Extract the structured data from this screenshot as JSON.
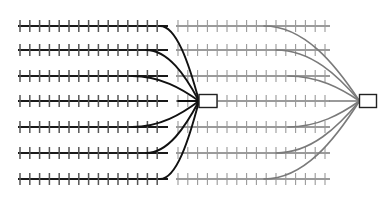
{
  "diagram": {
    "type": "rail-network-schematic",
    "canvas": {
      "width": 388,
      "height": 204,
      "background": "#ffffff"
    },
    "colors": {
      "left_rail": "#1a1a1a",
      "right_rail": "#7a7a7a",
      "left_tie": "#555555",
      "right_tie": "#9a9a9a",
      "connector": "#111111",
      "node_fill": "#ffffff",
      "node_stroke": "#222222"
    },
    "geometry": {
      "rail_width_left": 1.9,
      "rail_width_right": 1.3,
      "tie_width_left": 1.5,
      "tie_width_right": 1.1,
      "tie_half_height": 6,
      "tie_spacing": 9.8,
      "connector_width": 1.9
    },
    "rows": [
      {
        "index": 0,
        "label": "track-1",
        "y": 26
      },
      {
        "index": 1,
        "label": "track-2",
        "y": 50
      },
      {
        "index": 2,
        "label": "track-3",
        "y": 76
      },
      {
        "index": 3,
        "label": "track-4",
        "y": 101
      },
      {
        "index": 4,
        "label": "track-5",
        "y": 127
      },
      {
        "index": 5,
        "label": "track-6",
        "y": 153
      },
      {
        "index": 6,
        "label": "track-7",
        "y": 179
      }
    ],
    "left_segments": {
      "x_start": 18,
      "x_end": 168,
      "description": "Seven dark parallel track runs forming the left fan"
    },
    "right_segments": {
      "x_start": 176,
      "x_end": 330,
      "description": "Seven light grey parallel track runs forming the right fan"
    },
    "nodes": [
      {
        "name": "center-node",
        "x": 208,
        "y": 101,
        "width": 18,
        "height": 13,
        "role": "central junction / interchange"
      },
      {
        "name": "right-node",
        "x": 368,
        "y": 101,
        "width": 17,
        "height": 13,
        "role": "right terminal junction"
      }
    ],
    "left_connectors": [
      {
        "from_row": 0,
        "to_node": "center-node",
        "side": "left",
        "style": "dark"
      },
      {
        "from_row": 1,
        "to_node": "center-node",
        "side": "left",
        "style": "dark"
      },
      {
        "from_row": 2,
        "to_node": "center-node",
        "side": "left",
        "style": "dark"
      },
      {
        "from_row": 3,
        "to_node": "center-node",
        "side": "left",
        "style": "dark"
      },
      {
        "from_row": 4,
        "to_node": "center-node",
        "side": "left",
        "style": "dark"
      },
      {
        "from_row": 5,
        "to_node": "center-node",
        "side": "left",
        "style": "dark"
      },
      {
        "from_row": 6,
        "to_node": "center-node",
        "side": "left",
        "style": "dark"
      }
    ],
    "right_connectors": [
      {
        "from_row": 0,
        "to_node": "right-node",
        "side": "right",
        "style": "grey"
      },
      {
        "from_row": 1,
        "to_node": "right-node",
        "side": "right",
        "style": "grey"
      },
      {
        "from_row": 2,
        "to_node": "right-node",
        "side": "right",
        "style": "grey"
      },
      {
        "from_row": 3,
        "to_node": "right-node",
        "side": "right",
        "style": "grey"
      },
      {
        "from_row": 4,
        "to_node": "right-node",
        "side": "right",
        "style": "grey"
      },
      {
        "from_row": 5,
        "to_node": "right-node",
        "side": "right",
        "style": "grey"
      },
      {
        "from_row": 6,
        "to_node": "right-node",
        "side": "right",
        "style": "grey"
      }
    ]
  }
}
